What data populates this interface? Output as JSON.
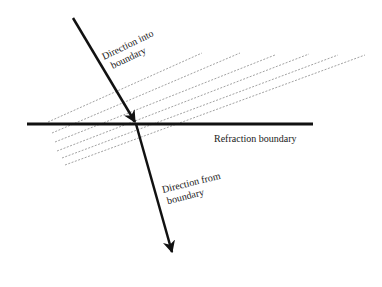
{
  "diagram": {
    "type": "refraction-diagram",
    "labels": {
      "incoming_line1": "Direction into",
      "incoming_line2": "boundary",
      "boundary": "Refraction boundary",
      "outgoing_line1": "Direction from",
      "outgoing_line2": "boundary"
    },
    "colors": {
      "line": "#111111",
      "dashed": "#8a8a8a",
      "background": "#ffffff"
    },
    "boundary_line": {
      "x1": 27,
      "y1": 124,
      "x2": 313,
      "y2": 124
    },
    "incoming_arrow": {
      "x1": 73,
      "y1": 18,
      "x2": 135,
      "y2": 122
    },
    "outgoing_arrow": {
      "x1": 136,
      "y1": 124,
      "x2": 172,
      "y2": 252
    },
    "dashed_lines": [
      {
        "x1": 48,
        "y1": 122,
        "x2": 202,
        "y2": 53
      },
      {
        "x1": 52,
        "y1": 133,
        "x2": 240,
        "y2": 53
      },
      {
        "x1": 55,
        "y1": 142,
        "x2": 275,
        "y2": 55
      },
      {
        "x1": 57,
        "y1": 151,
        "x2": 309,
        "y2": 54
      },
      {
        "x1": 62,
        "y1": 158,
        "x2": 338,
        "y2": 55
      },
      {
        "x1": 65,
        "y1": 165,
        "x2": 365,
        "y2": 55
      }
    ]
  }
}
